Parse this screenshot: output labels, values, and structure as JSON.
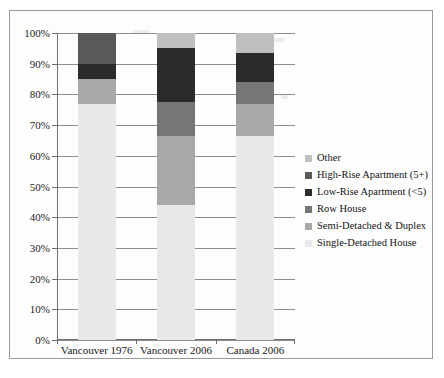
{
  "chart_data": {
    "type": "bar",
    "subtype": "stacked-100-percent",
    "title": "",
    "xlabel": "",
    "ylabel": "",
    "ylim": [
      0,
      100
    ],
    "grid": true,
    "legend_position": "right",
    "categories": [
      "Vancouver 1976",
      "Vancouver 2006",
      "Canada 2006"
    ],
    "y_ticks": [
      "0%",
      "10%",
      "20%",
      "30%",
      "40%",
      "50%",
      "60%",
      "70%",
      "80%",
      "90%",
      "100%"
    ],
    "y_tick_values": [
      0,
      10,
      20,
      30,
      40,
      50,
      60,
      70,
      80,
      90,
      100
    ],
    "series": [
      {
        "name": "Single-Detached House",
        "color": "#e8e8e8",
        "values": [
          77.0,
          44.0,
          66.5
        ]
      },
      {
        "name": "Semi-Detached & Duplex",
        "color": "#a8a8a8",
        "values": [
          8.0,
          22.5,
          10.5
        ]
      },
      {
        "name": "Row House",
        "color": "#767676",
        "values": [
          0.0,
          11.0,
          7.0
        ]
      },
      {
        "name": "Low-Rise Apartment (<5)",
        "color": "#2b2b2b",
        "values": [
          5.0,
          17.5,
          9.5
        ]
      },
      {
        "name": "High-Rise Apartment (5+)",
        "color": "#595959",
        "values": [
          10.0,
          0.0,
          0.0
        ]
      },
      {
        "name": "Other",
        "color": "#bfbfbf",
        "values": [
          0.0,
          5.0,
          6.5
        ]
      }
    ],
    "legend_order": [
      "Other",
      "High-Rise Apartment (5+)",
      "Low-Rise Apartment (<5)",
      "Row House",
      "Semi-Detached & Duplex",
      "Single-Detached House"
    ],
    "stack_order_bottom_to_top": [
      "Single-Detached House",
      "Semi-Detached & Duplex",
      "Row House",
      "Low-Rise Apartment (<5)",
      "High-Rise Apartment (5+)",
      "Other"
    ]
  },
  "legend": {
    "items": [
      {
        "label": "Other",
        "color": "#bfbfbf"
      },
      {
        "label": "High-Rise Apartment (5+)",
        "color": "#595959"
      },
      {
        "label": "Low-Rise Apartment (<5)",
        "color": "#2b2b2b"
      },
      {
        "label": "Row House",
        "color": "#767676"
      },
      {
        "label": "Semi-Detached & Duplex",
        "color": "#a8a8a8"
      },
      {
        "label": "Single-Detached House",
        "color": "#e8e8e8"
      }
    ]
  },
  "axis": {
    "y_labels": [
      "100%",
      "90%",
      "80%",
      "70%",
      "60%",
      "50%",
      "40%",
      "30%",
      "20%",
      "10%",
      "0%"
    ],
    "x_labels": [
      "Vancouver 1976",
      "Vancouver 2006",
      "Canada 2006"
    ]
  },
  "colors": {
    "frame_border": "#9a9a9a",
    "gridline": "#8d8d8d",
    "axis_line": "#6f6f6f",
    "text": "#1b1b1b",
    "plot_background": "#fdfdfd"
  }
}
